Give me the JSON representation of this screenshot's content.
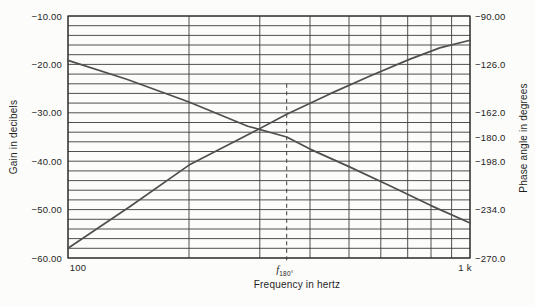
{
  "figure": {
    "x_axis_title": "Frequency in hertz",
    "left_axis_title": "Gain in decibels",
    "right_axis_title": "Phase angle in degrees",
    "x_tick_first": "100",
    "x_tick_last": "1 k",
    "f180_base": "f",
    "f180_sub": "180°"
  },
  "colors": {
    "background": "#fcfcfa",
    "grid": "#3c3c3c",
    "border": "#303030",
    "curve": "#4f4f4f",
    "dashed": "#3c3c3c",
    "text": "#1f1f1f"
  },
  "chart_data": {
    "type": "line",
    "title": "",
    "x_axis": {
      "label": "Frequency in hertz",
      "scale": "log",
      "range_hz": [
        100,
        1000
      ],
      "gridlines_hz": [
        100,
        200,
        300,
        400,
        500,
        600,
        700,
        800,
        900,
        1000
      ],
      "tick_labels": [
        "100",
        "1 k"
      ]
    },
    "y_axis_left": {
      "label": "Gain in decibels",
      "range_db": [
        -60,
        -10
      ],
      "grid_step_db": 2,
      "ticks": [
        {
          "label": "−10.00",
          "value": -10
        },
        {
          "label": "−20.00",
          "value": -20
        },
        {
          "label": "−30.00",
          "value": -30
        },
        {
          "label": "−40.00",
          "value": -40
        },
        {
          "label": "−50.00",
          "value": -50
        },
        {
          "label": "−60.00",
          "value": -60
        }
      ]
    },
    "y_axis_right": {
      "label": "Phase angle in degrees",
      "range_deg": [
        -270,
        -90
      ],
      "ticks": [
        {
          "label": "−90.00",
          "value": -90
        },
        {
          "label": "−126.0",
          "value": -126
        },
        {
          "label": "−162.0",
          "value": -162
        },
        {
          "label": "−180.0",
          "value": -180
        },
        {
          "label": "−198.0",
          "value": -198
        },
        {
          "label": "−234.0",
          "value": -234
        },
        {
          "label": "−270.0",
          "value": -270
        }
      ]
    },
    "series": [
      {
        "name": "gain",
        "axis": "left",
        "unit": "dB",
        "points": [
          [
            100,
            -58
          ],
          [
            143,
            -49.3
          ],
          [
            200,
            -40.8
          ],
          [
            284,
            -34.3
          ],
          [
            350,
            -30.3
          ],
          [
            448,
            -26.1
          ],
          [
            564,
            -22.4
          ],
          [
            709,
            -18.9
          ],
          [
            841,
            -16.6
          ],
          [
            1000,
            -15
          ]
        ]
      },
      {
        "name": "phase",
        "axis": "right",
        "unit": "degrees",
        "points": [
          [
            100,
            -123
          ],
          [
            140,
            -137
          ],
          [
            200,
            -154
          ],
          [
            280,
            -172
          ],
          [
            350,
            -180
          ],
          [
            400,
            -189
          ],
          [
            500,
            -202
          ],
          [
            630,
            -216
          ],
          [
            800,
            -231
          ],
          [
            1000,
            -244
          ]
        ]
      }
    ],
    "annotations": {
      "f180_hz": 350,
      "phase_at_f180_deg": -180,
      "gain_at_f180_db": -30.3,
      "dashed_line_top_db": -24,
      "dashed_line_bottom_db": -61
    },
    "legend": "none",
    "grid": "on"
  }
}
